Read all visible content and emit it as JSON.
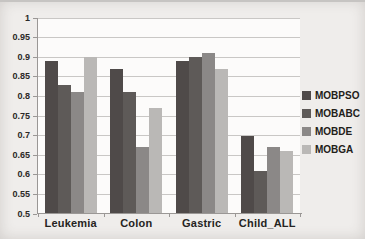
{
  "chart_data": {
    "type": "bar",
    "title": "",
    "xlabel": "",
    "ylabel": "",
    "categories": [
      "Leukemia",
      "Colon",
      "Gastric",
      "Child_ALL"
    ],
    "series": [
      {
        "name": "MOBPSO",
        "color": "#4f4a49",
        "values": [
          0.89,
          0.87,
          0.89,
          0.7
        ]
      },
      {
        "name": "MOBABC",
        "color": "#5e5a58",
        "values": [
          0.83,
          0.81,
          0.9,
          0.61
        ]
      },
      {
        "name": "MOBDE",
        "color": "#8b8887",
        "values": [
          0.81,
          0.67,
          0.91,
          0.67
        ]
      },
      {
        "name": "MOBGA",
        "color": "#bab8b6",
        "values": [
          0.9,
          0.77,
          0.87,
          0.66
        ]
      }
    ],
    "ylim": [
      0.5,
      1.0
    ],
    "ytick_step": 0.05,
    "ytick_labels": [
      "1",
      "0.95",
      "0.9",
      "0.85",
      "0.8",
      "0.75",
      "0.7",
      "0.65",
      "0.6",
      "0.55",
      "0.5"
    ],
    "grid": true,
    "legend_position": "right",
    "colors": {
      "background": "#efedeb",
      "plot_background": "#fcfbfa",
      "gridline": "#c9c7c5",
      "axis": "#9a9795",
      "text": "#2b2927"
    }
  }
}
